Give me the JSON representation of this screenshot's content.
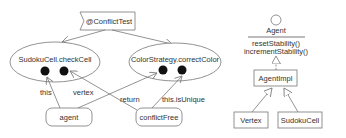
{
  "left_diagram": {
    "annotation": {
      "label": "@ConflictTest"
    },
    "method_nodes": [
      {
        "label": "SudokuCell.checkCell"
      },
      {
        "label": "ColorStrategy.correctColor"
      }
    ],
    "value_nodes": [
      {
        "label": "agent"
      },
      {
        "label": "conflictFree"
      }
    ],
    "edge_labels": {
      "this": "this",
      "vertex": "vertex",
      "return": "return",
      "this_isUnique": "this.isUnique"
    }
  },
  "right_diagram": {
    "interface": {
      "name": "Agent",
      "methods": [
        "resetStability()",
        "incrementStability()"
      ]
    },
    "impl_class": {
      "name": "AgentImpl"
    },
    "subclasses": [
      {
        "name": "Vertex"
      },
      {
        "name": "SudokuCell"
      }
    ]
  },
  "colors": {
    "stroke": "#777777",
    "text": "#333333",
    "dot": "#111111",
    "background": "#ffffff"
  }
}
